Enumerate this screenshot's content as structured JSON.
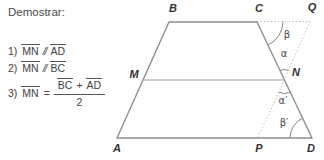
{
  "prove": {
    "title": "Demostrar:",
    "items": [
      {
        "num": "1)",
        "seg1": "MN",
        "rel": "//",
        "seg2": "AD"
      },
      {
        "num": "2)",
        "seg1": "MN",
        "rel": "//",
        "seg2": "BC"
      },
      {
        "num": "3)",
        "seg1": "MN",
        "eq": "=",
        "frac": {
          "left": "BC",
          "op": "+",
          "right": "AD",
          "den": "2"
        }
      }
    ]
  },
  "diagram": {
    "vertices": {
      "A": "A",
      "B": "B",
      "C": "C",
      "D": "D",
      "M": "M",
      "N": "N",
      "P": "P",
      "Q": "Q"
    },
    "angles": {
      "beta": "β",
      "alpha": "α",
      "alpha_prime": "α′",
      "beta_prime": "β′"
    }
  },
  "colors": {
    "solid_line": "#8f8f8f",
    "dotted_line": "#b8b8b8",
    "vertex_label": "#333333",
    "text": "#424242"
  }
}
